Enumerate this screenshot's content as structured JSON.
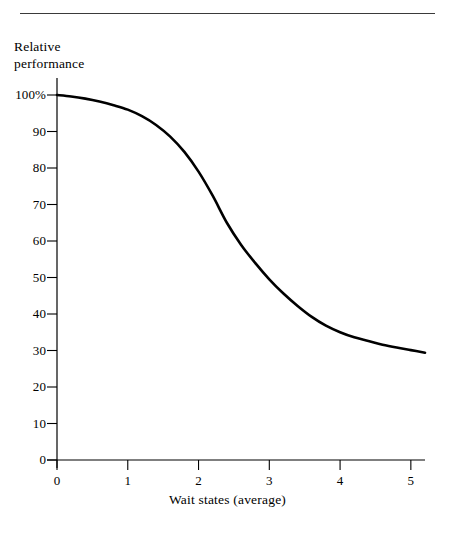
{
  "figure": {
    "has_top_rule": true,
    "background_color": "#ffffff",
    "ink_color": "#000000",
    "rule_color": "#3a3a3a"
  },
  "chart_data": {
    "type": "line",
    "title": "",
    "subtitle": "",
    "xlabel": "Wait states (average)",
    "ylabel": "Relative\nperformance",
    "ylabel_line1": "Relative",
    "ylabel_line2": "performance",
    "xlim": [
      0,
      5.2
    ],
    "ylim": [
      0,
      100
    ],
    "xticks": [
      0,
      1,
      2,
      3,
      4,
      5
    ],
    "xtick_labels": [
      "0",
      "1",
      "2",
      "3",
      "4",
      "5"
    ],
    "yticks": [
      0,
      10,
      20,
      30,
      40,
      50,
      60,
      70,
      80,
      90,
      100
    ],
    "ytick_labels": [
      "0",
      "10",
      "20",
      "30",
      "40",
      "50",
      "60",
      "70",
      "80",
      "90",
      "100%"
    ],
    "grid": false,
    "legend": false,
    "legend_position": "none",
    "axis_style": "left-and-bottom-spines-with-outward-ticks",
    "series": [
      {
        "name": "Relative performance",
        "color": "#000000",
        "line_width": 2.6,
        "x": [
          0.0,
          0.2,
          0.4,
          0.6,
          0.8,
          1.0,
          1.2,
          1.4,
          1.6,
          1.8,
          2.0,
          2.2,
          2.4,
          2.6,
          2.8,
          3.0,
          3.2,
          3.4,
          3.6,
          3.8,
          4.0,
          4.2,
          4.4,
          4.6,
          4.8,
          5.0,
          5.2
        ],
        "y": [
          100.0,
          99.6,
          99.0,
          98.2,
          97.2,
          96.0,
          94.2,
          91.8,
          88.6,
          84.4,
          79.0,
          72.4,
          65.0,
          59.0,
          54.0,
          49.5,
          45.6,
          42.2,
          39.2,
          36.8,
          35.0,
          33.6,
          32.6,
          31.6,
          30.8,
          30.1,
          29.4
        ]
      }
    ]
  }
}
